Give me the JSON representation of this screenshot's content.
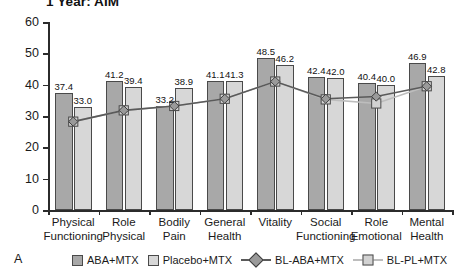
{
  "panel_letter": "A",
  "chart_data": {
    "type": "bar",
    "title": "1 Year: AIM",
    "xlabel": "",
    "ylabel": "",
    "ylim": [
      0,
      60
    ],
    "yticks": [
      0,
      10,
      20,
      30,
      40,
      50,
      60
    ],
    "grid": false,
    "legend_position": "bottom",
    "categories": [
      "Physical\nFunctioning",
      "Role\nPhysical",
      "Bodily\nPain",
      "General\nHealth",
      "Vitality",
      "Social\nFunctioning",
      "Role\nEmotional",
      "Mental\nHealth"
    ],
    "series": [
      {
        "name": "ABA+MTX",
        "kind": "bar",
        "color": "#a8a8a8",
        "values": [
          37.4,
          41.2,
          33.2,
          41.1,
          48.5,
          42.4,
          40.4,
          46.9
        ],
        "labels": [
          "37.4",
          "41.2",
          "33.2",
          "41.1",
          "48.5",
          "42.4",
          "40.4",
          "46.9"
        ]
      },
      {
        "name": "Placebo+MTX",
        "kind": "bar",
        "color": "#d7d7d7",
        "values": [
          33.0,
          39.4,
          38.9,
          41.3,
          46.2,
          42.0,
          40.0,
          42.8
        ],
        "labels": [
          "33.0",
          "39.4",
          "38.9",
          "41.3",
          "46.2",
          "42.0",
          "40.0",
          "42.8"
        ]
      },
      {
        "name": "BL-ABA+MTX",
        "kind": "line",
        "marker": "diamond",
        "color": "#5a5a5a",
        "values": [
          28.2,
          31.8,
          33.2,
          35.5,
          41.0,
          35.5,
          36.2,
          39.5
        ]
      },
      {
        "name": "BL-PL+MTX",
        "kind": "line",
        "marker": "square",
        "color": "#bdbdbd",
        "values": [
          28.2,
          31.8,
          33.2,
          35.5,
          41.0,
          35.3,
          34.0,
          39.5
        ]
      }
    ]
  },
  "legend": [
    {
      "label": "ABA+MTX",
      "style": "swatch-dark"
    },
    {
      "label": "Placebo+MTX",
      "style": "swatch-light"
    },
    {
      "label": "BL-ABA+MTX",
      "style": "line-dark-diamond"
    },
    {
      "label": "BL-PL+MTX",
      "style": "line-light-square"
    }
  ]
}
